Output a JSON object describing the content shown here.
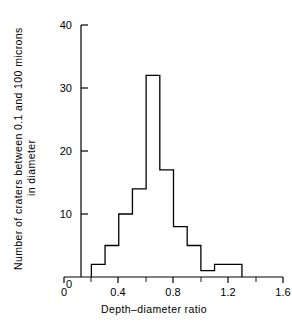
{
  "chart_data": {
    "type": "bar",
    "title": "",
    "xlabel": "Depth–diameter ratio",
    "ylabel": "Number of craters between 0.1 and 100 microns in diameter",
    "ylabel_line1": "Number of craters between 0.1 and 100 microns",
    "ylabel_line2": "in diameter",
    "xlim": [
      0,
      1.6
    ],
    "ylim": [
      0,
      40
    ],
    "grid": false,
    "legend": "none",
    "bin_width": 0.1,
    "bin_edges": [
      0.2,
      0.3,
      0.4,
      0.5,
      0.6,
      0.7,
      0.8,
      0.9,
      1.0,
      1.1,
      1.2,
      1.3
    ],
    "categories": [
      "0.2-0.3",
      "0.3-0.4",
      "0.4-0.5",
      "0.5-0.6",
      "0.6-0.7",
      "0.7-0.8",
      "0.8-0.9",
      "0.9-1.0",
      "1.0-1.1",
      "1.1-1.2",
      "1.2-1.3"
    ],
    "values": [
      2,
      5,
      10,
      14,
      32,
      17,
      8,
      5,
      1,
      2,
      2
    ],
    "x_ticks_major": [
      0,
      0.4,
      0.8,
      1.2,
      1.6
    ],
    "x_tick_labels": [
      "0",
      "0.4",
      "0.8",
      "1.2",
      "1.6"
    ],
    "x_ticks_minor": [
      0.2,
      0.6,
      1.0,
      1.4
    ],
    "y_ticks_major": [
      0,
      10,
      20,
      30,
      40
    ],
    "y_tick_labels": [
      "0",
      "10",
      "20",
      "30",
      "40"
    ],
    "line_color": "#000000",
    "axis_color": "#000000",
    "background": "#ffffff"
  }
}
